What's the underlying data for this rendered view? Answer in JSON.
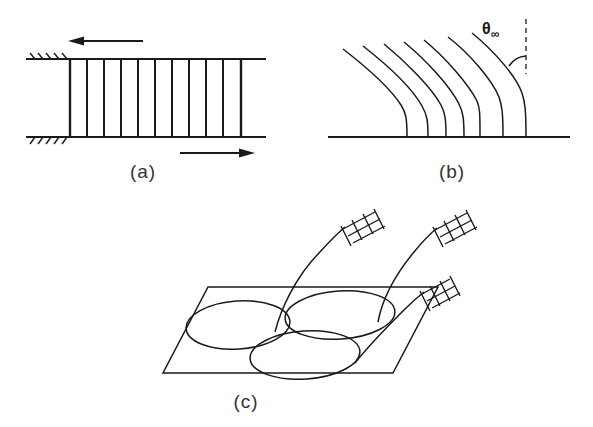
{
  "figure": {
    "type": "line-drawing-schematic",
    "background_color": "#ffffff",
    "ink_color": "#1a1a1a",
    "panel_count": 3
  },
  "panels": [
    {
      "id": "a",
      "label": "(a)",
      "label_x": 143,
      "label_y": 178,
      "description": "ladder-like parallel array between two fixed hatched walls with opposing shear arrows",
      "rails": {
        "top_y": 59,
        "bottom_y": 137,
        "left_x": 70,
        "right_x": 245
      },
      "rung_count": 11,
      "rungs_x": [
        70,
        87,
        104,
        121,
        138,
        155,
        172,
        189,
        206,
        223,
        240
      ],
      "hatching": {
        "top_wall_x_start": 26,
        "top_wall_x_end": 70,
        "bottom_wall_x_start": 26,
        "bottom_wall_x_end": 70,
        "tick_count": 5
      },
      "arrows": [
        {
          "name": "top-shear-arrow",
          "direction": "left",
          "x_tail": 142,
          "x_head": 72,
          "y": 41
        },
        {
          "name": "bottom-shear-arrow",
          "direction": "right",
          "x_tail": 180,
          "x_head": 250,
          "y": 153
        }
      ]
    },
    {
      "id": "b",
      "label": "(b)",
      "label_x": 452,
      "label_y": 178,
      "description": "family of curved filaments rising from a horizontal baseline, bending over toward the upper-left, with limiting angle theta-infinity marked from the vertical dashed reference",
      "baseline": {
        "y": 137,
        "x_start": 328,
        "x_end": 570
      },
      "curve_count": 7,
      "curve_base_x": [
        407,
        428,
        447,
        464,
        479,
        502,
        525
      ],
      "curve_base_top_y": [
        120,
        128,
        126,
        129,
        109,
        128,
        137
      ],
      "curve_top_x": [
        343,
        363,
        384,
        404,
        424,
        448,
        472
      ],
      "curve_top_y": [
        49,
        46,
        44,
        42,
        40,
        37,
        33
      ],
      "angle_marker": {
        "symbol": "θ",
        "subscript": "∞",
        "label_x": 484,
        "label_y": 31,
        "vertex_x": 525,
        "vertex_y": 56,
        "dashed_reference_x": 525,
        "dashed_top_y": 20,
        "dashed_bottom_y": 70,
        "arc_radius": 22
      }
    },
    {
      "id": "c",
      "label": "(c)",
      "label_x": 246,
      "label_y": 408,
      "description": "three overlapping ellipses (convection cells) on an oblique-projected plane, each pierced by a curved filament terminating in a crosshatched grid marker above the plane",
      "plane": {
        "name": "oblique-plane-parallelogram",
        "points": "208,287 438,287 393,373 163,373"
      },
      "ellipses": [
        {
          "name": "ellipse-left",
          "cx": 238,
          "cy": 325,
          "rx": 52,
          "ry": 24,
          "rotation": -4
        },
        {
          "name": "ellipse-right",
          "cx": 340,
          "cy": 315,
          "rx": 55,
          "ry": 24,
          "rotation": -4
        },
        {
          "name": "ellipse-front",
          "cx": 305,
          "cy": 355,
          "rx": 55,
          "ry": 24,
          "rotation": -4
        }
      ],
      "filaments": [
        {
          "name": "filament-left",
          "base_x": 275,
          "base_y": 330,
          "tip_x": 345,
          "tip_y": 227,
          "marker_x": 355,
          "marker_y": 222
        },
        {
          "name": "filament-right",
          "base_x": 378,
          "base_y": 318,
          "tip_x": 436,
          "tip_y": 228,
          "marker_x": 446,
          "marker_y": 222
        },
        {
          "name": "filament-front",
          "base_x": 355,
          "base_y": 360,
          "tip_x": 423,
          "tip_y": 292,
          "marker_x": 432,
          "marker_y": 287
        }
      ],
      "marker_style": {
        "name": "crosshatch-grid-marker",
        "bar_count": 3,
        "rung_count": 4
      }
    }
  ]
}
